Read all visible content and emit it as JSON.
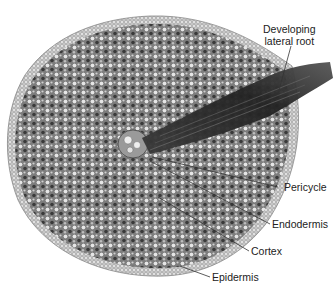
{
  "figure": {
    "labels": {
      "developing_lateral_root_line1": "Developing",
      "developing_lateral_root_line2": "lateral root",
      "pericycle": "Pericycle",
      "endodermis": "Endodermis",
      "cortex": "Cortex",
      "epidermis": "Epidermis"
    },
    "colors": {
      "background": "#ffffff",
      "tissue_light": "#d9d9d9",
      "tissue_mid": "#8a8a8a",
      "tissue_dark": "#2e2e2e",
      "label_text": "#222222",
      "leader_line": "#333333"
    }
  }
}
